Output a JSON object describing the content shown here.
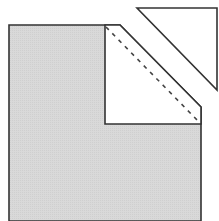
{
  "diagram": {
    "colors": {
      "background": "#ffffff",
      "fill_gray": "#d6d6d6",
      "stroke": "#333333",
      "white_fill": "#ffffff"
    },
    "shapes": {
      "gray_square": {
        "points": "9,25 120,25 201,107 201,221 9,221"
      },
      "white_flap": {
        "points": "105,25 120,25 201,107 201,124 105,124"
      },
      "fold_line": {
        "x1": 106,
        "y1": 26,
        "x2": 200,
        "y2": 123
      },
      "detached_triangle": {
        "points": "137,8 217,8 217,90"
      }
    }
  }
}
